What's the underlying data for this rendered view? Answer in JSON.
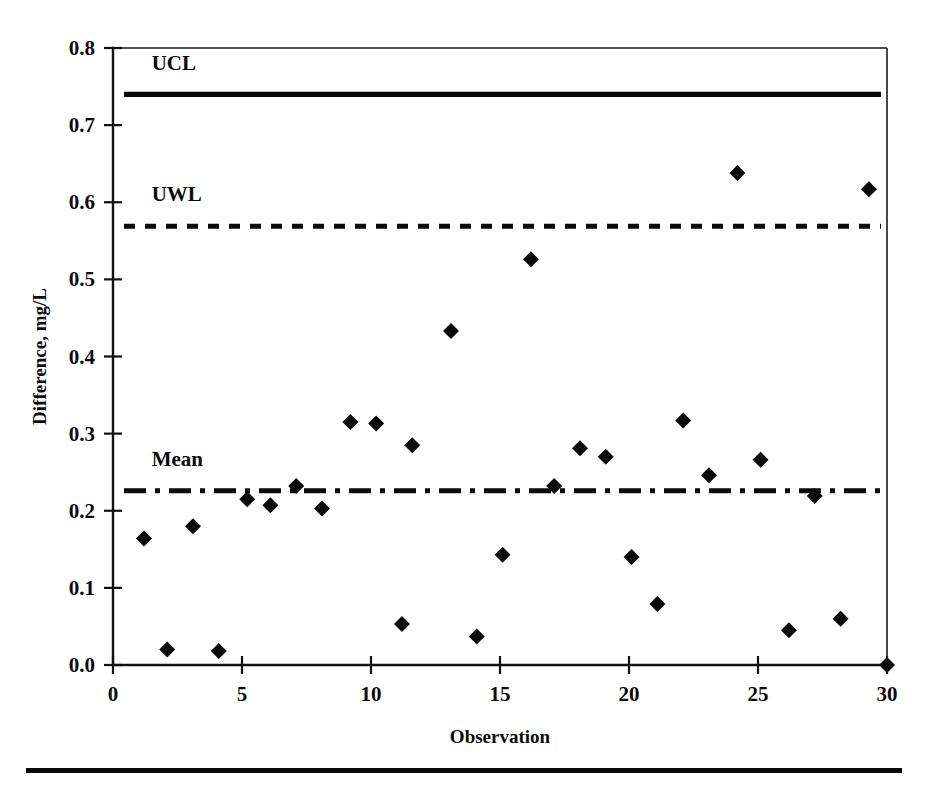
{
  "figure": {
    "background_color": "#ffffff",
    "ink_color": "#0a0a0a",
    "bottom_rule": "horizontal-rule"
  },
  "chart_data": {
    "type": "scatter",
    "title": "",
    "subtitle": "",
    "xlabel": "Observation",
    "ylabel": "Difference, mg/L",
    "xlim": [
      0,
      30
    ],
    "ylim": [
      0.0,
      0.8
    ],
    "xticks": [
      0,
      5,
      10,
      15,
      20,
      25,
      30
    ],
    "xticklabels": [
      "0",
      "5",
      "10",
      "15",
      "20",
      "25",
      "30"
    ],
    "yticks": [
      0.0,
      0.1,
      0.2,
      0.3,
      0.4,
      0.5,
      0.6,
      0.7,
      0.8
    ],
    "yticklabels": [
      "0.0",
      "0.1",
      "0.2",
      "0.3",
      "0.4",
      "0.5",
      "0.6",
      "0.7",
      "0.8"
    ],
    "grid": false,
    "legend_position": "in-plot-inline-labels",
    "marker": "diamond",
    "x": [
      1.2,
      2.1,
      3.1,
      4.1,
      5.2,
      6.1,
      7.1,
      8.1,
      9.2,
      10.2,
      11.2,
      11.6,
      13.1,
      14.1,
      15.1,
      16.2,
      17.1,
      18.1,
      19.1,
      20.1,
      21.1,
      22.1,
      23.1,
      24.2,
      25.1,
      26.2,
      27.2,
      28.2,
      29.3,
      30.0
    ],
    "y": [
      0.164,
      0.02,
      0.18,
      0.018,
      0.215,
      0.207,
      0.232,
      0.203,
      0.315,
      0.313,
      0.053,
      0.285,
      0.433,
      0.037,
      0.143,
      0.526,
      0.232,
      0.281,
      0.27,
      0.14,
      0.079,
      0.317,
      0.246,
      0.638,
      0.266,
      0.045,
      0.219,
      0.06,
      0.617,
      0.0
    ],
    "reference_lines": [
      {
        "name": "UCL",
        "label": "UCL",
        "value": 0.74,
        "style": "solid",
        "label_x": 1.5,
        "label_y": 0.772
      },
      {
        "name": "UWL",
        "label": "UWL",
        "value": 0.569,
        "style": "dashed",
        "label_x": 1.5,
        "label_y": 0.601
      },
      {
        "name": "Mean",
        "label": "Mean",
        "value": 0.226,
        "style": "dash-dot",
        "label_x": 1.5,
        "label_y": 0.258
      }
    ]
  }
}
